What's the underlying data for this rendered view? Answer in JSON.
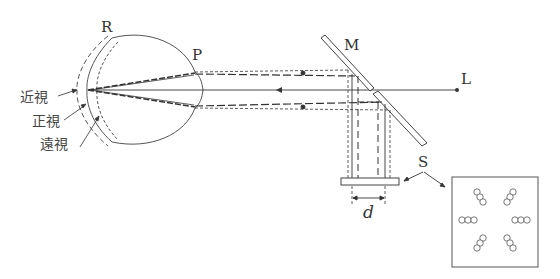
{
  "diagram": {
    "type": "optical-schematic",
    "labels": {
      "retina": "R",
      "pupil": "P",
      "mirror": "M",
      "light_source": "L",
      "screen": "S",
      "separation": "d",
      "myopia": "近視",
      "emmetropia": "正視",
      "hyperopia": "遠視"
    },
    "colors": {
      "line": "#333333",
      "background": "#ffffff"
    },
    "screen_pattern": {
      "groups": 6,
      "circles_per_group": 3,
      "layout": [
        "top-left diagonal",
        "top-right diagonal",
        "middle-left horizontal",
        "middle-right horizontal",
        "bottom-left diagonal",
        "bottom-right diagonal"
      ]
    }
  }
}
